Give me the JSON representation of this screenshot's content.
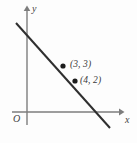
{
  "figure": {
    "background_color": "#fdfdfd",
    "width": 137,
    "height": 143
  },
  "axes": {
    "x_axis_label": "x",
    "y_axis_label": "y",
    "origin_label": "O",
    "axis_color": "#7d7d7d",
    "x_axis": {
      "x1": 12,
      "y1": 112,
      "x2": 122,
      "y2": 112,
      "arrow": "right"
    },
    "y_axis": {
      "x1": 27,
      "y1": 125,
      "x2": 27,
      "y2": 8,
      "arrow": "up"
    }
  },
  "chart_data": {
    "type": "line",
    "title": "",
    "xlabel": "x",
    "ylabel": "y",
    "grid": false,
    "legend": null,
    "series": [
      {
        "name": "line",
        "points": [
          {
            "x": 3,
            "y": 3,
            "label": "(3, 3)",
            "marker": "filled-dot"
          },
          {
            "x": 4,
            "y": 2,
            "label": "(4, 2)",
            "marker": "filled-dot"
          }
        ],
        "slope": -1,
        "color": "#2f2f2f"
      }
    ],
    "annotations": [
      {
        "text": "(3, 3)",
        "attached_to_point": {
          "x": 3,
          "y": 3
        }
      },
      {
        "text": "(4, 2)",
        "attached_to_point": {
          "x": 4,
          "y": 2
        }
      },
      {
        "text": "O",
        "attached_to_point": {
          "x": 0,
          "y": 0
        }
      }
    ]
  },
  "geometry": {
    "line_color": "#2f2f2f",
    "line_width": 2,
    "line_start": {
      "x": 16,
      "y": 23
    },
    "line_end": {
      "x": 110,
      "y": 128
    },
    "marker_color": "#1c1c1c",
    "marker_radius": 2.6,
    "marker_1": {
      "x": 63,
      "y": 66
    },
    "marker_2": {
      "x": 75,
      "y": 81
    }
  }
}
